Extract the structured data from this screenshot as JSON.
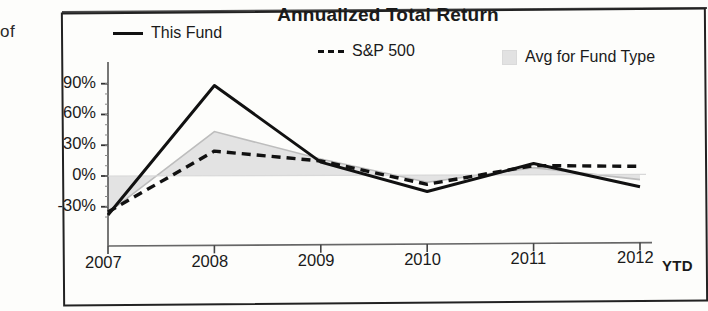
{
  "page": {
    "left_fragment": "of"
  },
  "chart": {
    "title": "Annualized Total Return",
    "legend": [
      {
        "label": "This Fund",
        "marker": "solid-line",
        "color": "#111111"
      },
      {
        "label": "S&P 500",
        "marker": "dashed-line",
        "color": "#111111"
      },
      {
        "label": "Avg for Fund Type",
        "marker": "area-swatch",
        "color": "#e2e2e2"
      }
    ],
    "x_axis_note": "YTD"
  },
  "chart_data": {
    "type": "line",
    "title": "Annualized Total Return",
    "xlabel": "",
    "ylabel": "",
    "categories": [
      "2007",
      "2008",
      "2009",
      "2010",
      "2011",
      "2012"
    ],
    "x_tick_labels": [
      "2007",
      "2008",
      "2009",
      "2010",
      "2011",
      "2012"
    ],
    "y_tick_labels": [
      "90%",
      "60%",
      "30%",
      "0%",
      "-30%"
    ],
    "y_ticks": [
      90,
      60,
      30,
      0,
      -30
    ],
    "ylim": [
      -42,
      95
    ],
    "grid": false,
    "legend_position": "top",
    "units": "percent",
    "series": [
      {
        "name": "This Fund",
        "style": "solid",
        "color": "#111111",
        "values": [
          -38,
          88,
          13,
          -16,
          11,
          -12
        ]
      },
      {
        "name": "S&P 500",
        "style": "dashed",
        "color": "#111111",
        "values": [
          -35,
          24,
          14,
          -9,
          9,
          8
        ]
      },
      {
        "name": "Avg for Fund Type",
        "style": "filled-area",
        "color": "#e2e2e2",
        "values": [
          -36,
          43,
          16,
          -7,
          7,
          -5
        ]
      }
    ],
    "annotations": [
      {
        "text": "YTD",
        "position": "after-2012-tick",
        "bold": true
      }
    ]
  }
}
